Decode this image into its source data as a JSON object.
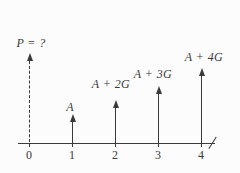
{
  "diagram": {
    "type": "cash-flow-diagram",
    "flows": [
      {
        "time": "0",
        "label": "P = ?",
        "direction": "up",
        "line_style": "dashed"
      },
      {
        "time": "1",
        "label": "A",
        "direction": "up",
        "line_style": "solid"
      },
      {
        "time": "2",
        "label": "A + 2G",
        "direction": "up",
        "line_style": "solid"
      },
      {
        "time": "3",
        "label": "A + 3G",
        "direction": "up",
        "line_style": "solid"
      },
      {
        "time": "4",
        "label": "A + 4G",
        "direction": "up",
        "line_style": "solid"
      }
    ],
    "axis": {
      "ticks": [
        "0",
        "1",
        "2",
        "3",
        "4"
      ],
      "end_mark": "/"
    },
    "colors": {
      "ink": "#3a3a3a",
      "background": "#fcfcfc"
    }
  }
}
